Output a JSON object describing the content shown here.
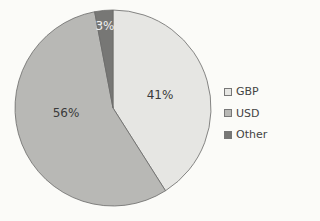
{
  "chart_data": {
    "type": "pie",
    "title": "",
    "categories": [
      "GBP",
      "USD",
      "Other"
    ],
    "values": [
      41,
      56,
      3
    ],
    "labels": [
      "41%",
      "56%",
      "3%"
    ],
    "colors": [
      "#e6e6e3",
      "#b8b8b5",
      "#777775"
    ],
    "start_angle": "12 o'clock",
    "direction": "clockwise",
    "legend_position": "right"
  },
  "legend": [
    {
      "label": "GBP",
      "color": "#e6e6e3"
    },
    {
      "label": "USD",
      "color": "#b8b8b5"
    },
    {
      "label": "Other",
      "color": "#777775"
    }
  ]
}
